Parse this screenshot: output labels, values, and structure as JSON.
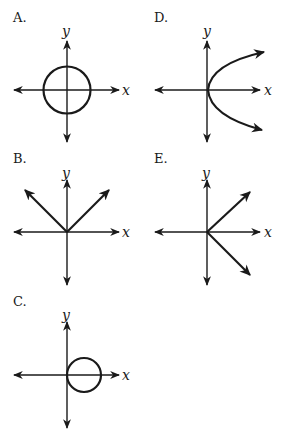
{
  "figure": {
    "axis_labels": {
      "x": "x",
      "y": "y"
    },
    "options": [
      {
        "id": "A",
        "label": "A.",
        "shape": "circle centered at origin"
      },
      {
        "id": "B",
        "label": "B.",
        "shape": "V shape opening upward from origin (y = |x|)"
      },
      {
        "id": "C",
        "label": "C.",
        "shape": "circle tangent to y-axis at origin, centered on positive x-axis"
      },
      {
        "id": "D",
        "label": "D.",
        "shape": "parabola opening right with vertex at origin (x = y^2)"
      },
      {
        "id": "E",
        "label": "E.",
        "shape": "sideways V opening right from origin (x = |y|)"
      }
    ]
  },
  "colors": {
    "ink": "#1a1a1a",
    "background": "#ffffff"
  }
}
